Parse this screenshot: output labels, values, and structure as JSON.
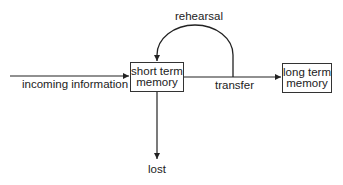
{
  "diagram": {
    "type": "flowchart",
    "nodes": {
      "short_term": {
        "line1": "short term",
        "line2": "memory"
      },
      "long_term": {
        "line1": "long term",
        "line2": "memory"
      }
    },
    "edges": {
      "incoming": "incoming information",
      "rehearsal": "rehearsal",
      "transfer": "transfer",
      "lost": "lost"
    },
    "colors": {
      "stroke": "#222222",
      "background": "#ffffff"
    }
  }
}
